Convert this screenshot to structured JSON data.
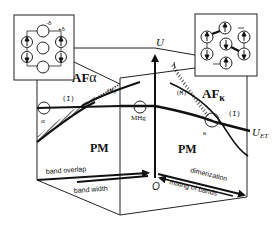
{
  "diagram": {
    "axis_vertical_label": "U",
    "origin_label": "O",
    "threshold_label": "U_ET",
    "threshold_label_main": "U",
    "threshold_label_sub": "ET",
    "regions": {
      "af_alpha": "AF",
      "af_alpha_sub": "α",
      "af_kappa": "AF",
      "af_kappa_sub": "κ",
      "pm_left": "PM",
      "pm_right": "PM"
    },
    "phase_markers": {
      "insulator_left": "(I)",
      "insulator_right": "(I)",
      "metal_left": "(M)",
      "metal_right": "(M)"
    },
    "points": {
      "alpha": "α",
      "mhg": "MHg",
      "kappa": "κ"
    },
    "axes": {
      "band_overlap": "band overlap",
      "band_width": "band width",
      "dimerization": "dimerization",
      "mixing_of_bands": "mixing of bands"
    },
    "inset_left": {
      "minus_delta": "-δ",
      "plus_delta": "+δ"
    }
  }
}
